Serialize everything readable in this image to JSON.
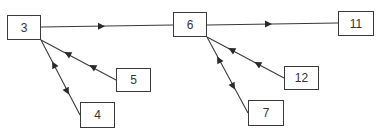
{
  "diagram": {
    "type": "flow",
    "nodes": [
      {
        "id": "n3",
        "label": "3",
        "x": 7,
        "y": 15,
        "w": 34,
        "h": 25
      },
      {
        "id": "n6",
        "label": "6",
        "x": 173,
        "y": 12,
        "w": 34,
        "h": 25
      },
      {
        "id": "n11",
        "label": "11",
        "x": 338,
        "y": 11,
        "w": 36,
        "h": 25
      },
      {
        "id": "n5",
        "label": "5",
        "x": 116,
        "y": 68,
        "w": 35,
        "h": 24
      },
      {
        "id": "n4",
        "label": "4",
        "x": 80,
        "y": 102,
        "w": 35,
        "h": 26
      },
      {
        "id": "n12",
        "label": "12",
        "x": 284,
        "y": 66,
        "w": 35,
        "h": 24
      },
      {
        "id": "n7",
        "label": "7",
        "x": 248,
        "y": 100,
        "w": 36,
        "h": 26
      }
    ],
    "edges": [
      {
        "from": "3",
        "to": "6",
        "arrows": "forward"
      },
      {
        "from": "6",
        "to": "11",
        "arrows": "forward"
      },
      {
        "from": "5",
        "to": "3",
        "arrows": "two arrowheads pointing toward 3"
      },
      {
        "from": "4",
        "to": "3",
        "arrows": "bidirectional"
      },
      {
        "from": "12",
        "to": "6",
        "arrows": "two arrowheads pointing toward 6"
      },
      {
        "from": "7",
        "to": "6",
        "arrows": "bidirectional"
      }
    ],
    "colors": {
      "line": "#3a3a3a",
      "background": "#ffffff"
    }
  }
}
